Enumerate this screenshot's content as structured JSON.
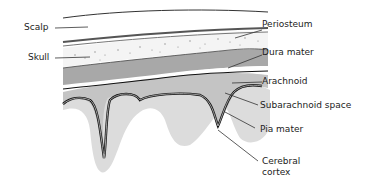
{
  "diagram": {
    "labels": {
      "scalp": "Scalp",
      "skull": "Skull",
      "periosteum": "Periosteum",
      "dura_mater": "Dura mater",
      "arachnoid": "Arachnoid",
      "subarachnoid_space": "Subarachnoid space",
      "pia_mater": "Pia mater",
      "cerebral_cortex_line1": "Cerebral",
      "cerebral_cortex_line2": "cortex"
    },
    "colors": {
      "line": "#222222",
      "dura": "#a8a8a8",
      "subarachnoid": "#c4c4c4",
      "cortex": "#dcdcdc",
      "skull_dots": "#888888"
    }
  }
}
